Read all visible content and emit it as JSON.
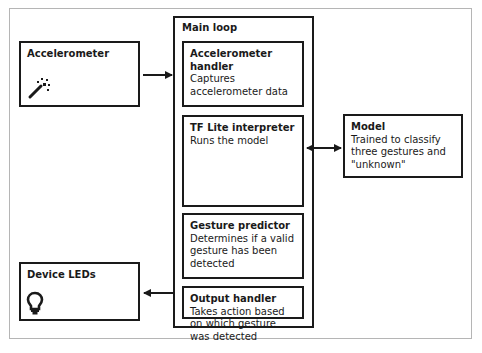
{
  "diagram": {
    "nodes": {
      "accelerometer": {
        "title": "Accelerometer",
        "icon": "magic-wand-icon"
      },
      "main_loop": {
        "title": "Main loop"
      },
      "accelerometer_handler": {
        "title": "Accelerometer handler",
        "description": "Captures accelerometer data"
      },
      "tflite_interpreter": {
        "title": "TF Lite interpreter",
        "description": "Runs the model"
      },
      "gesture_predictor": {
        "title": "Gesture predictor",
        "description": "Determines if a valid gesture has been detected"
      },
      "output_handler": {
        "title": "Output handler",
        "description": "Takes action based on which gesture was detected"
      },
      "model": {
        "title": "Model",
        "description": "Trained to classify three gestures and \"unknown\""
      },
      "device_leds": {
        "title": "Device LEDs",
        "icon": "lightbulb-icon"
      }
    },
    "edges": [
      {
        "from": "accelerometer",
        "to": "main_loop",
        "type": "single-arrow"
      },
      {
        "from": "tflite_interpreter",
        "to": "model",
        "type": "double-arrow"
      },
      {
        "from": "output_handler",
        "to": "device_leds",
        "type": "single-arrow"
      }
    ],
    "colors": {
      "stroke": "#1a1a1a",
      "frame": "#b5b5b5",
      "background": "#ffffff"
    }
  }
}
